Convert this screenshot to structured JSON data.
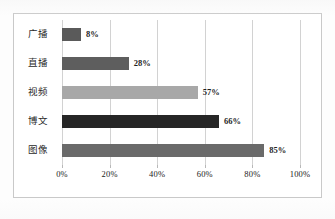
{
  "chart_data": {
    "type": "bar",
    "orientation": "horizontal",
    "title": "",
    "subtitle": "",
    "xlabel": "",
    "ylabel": "",
    "categories": [
      "广播",
      "直播",
      "视频",
      "博文",
      "图像"
    ],
    "values": [
      8,
      28,
      57,
      66,
      85
    ],
    "value_labels": [
      "8%",
      "28%",
      "57%",
      "66%",
      "85%"
    ],
    "xlim": [
      0,
      100
    ],
    "xticks": [
      0,
      20,
      40,
      60,
      80,
      100
    ],
    "xtick_labels": [
      "0%",
      "20%",
      "40%",
      "60%",
      "80%",
      "100%"
    ],
    "grid": true,
    "grid_axis": "x",
    "legend": false,
    "legend_position": "none",
    "bar_colors": [
      "#5a5a5a",
      "#5e5e5e",
      "#a8a8a8",
      "#262626",
      "#6a6a6a"
    ],
    "series": [
      {
        "name": "占比",
        "values": [
          8,
          28,
          57,
          66,
          85
        ]
      }
    ]
  },
  "frame": {
    "border_color": "#c9c9c9",
    "background": "#ffffff"
  },
  "axis": {
    "gridline_color": "#d2d2d2",
    "tick_label_color": "#222222"
  }
}
